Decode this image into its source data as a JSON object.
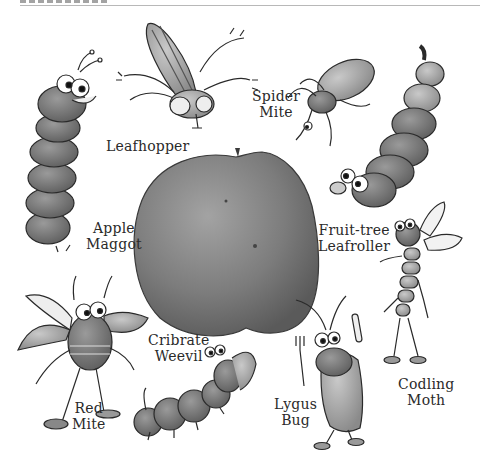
{
  "figure": {
    "center_object": "apple",
    "pests": [
      {
        "id": "leafhopper",
        "lines": [
          "Leafhopper"
        ]
      },
      {
        "id": "spider-mite",
        "lines": [
          "Spider",
          "Mite"
        ]
      },
      {
        "id": "apple-maggot",
        "lines": [
          "Apple",
          "Maggot"
        ]
      },
      {
        "id": "fruit-tree-leafroller",
        "lines": [
          "Fruit-tree",
          "Leafroller"
        ]
      },
      {
        "id": "cribrate-weevil",
        "lines": [
          "Cribrate",
          "Weevil"
        ]
      },
      {
        "id": "red-mite",
        "lines": [
          "Red",
          "Mite"
        ]
      },
      {
        "id": "lygus-bug",
        "lines": [
          "Lygus",
          "Bug"
        ]
      },
      {
        "id": "codling-moth",
        "lines": [
          "Codling",
          "Moth"
        ]
      }
    ]
  },
  "colors": {
    "background": "#ffffff",
    "apple": "#7d7d7d",
    "ink": "#2a2a2a",
    "rule": "#b8b8b8"
  }
}
